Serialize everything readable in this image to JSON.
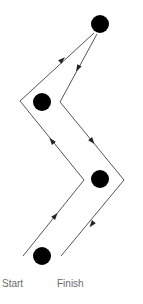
{
  "diagram": {
    "type": "path-around-obstacles",
    "colors": {
      "line": "#555555",
      "node": "#000000",
      "arrow": "#222222",
      "label": "#6b6b6b"
    },
    "nodes": [
      {
        "id": "top",
        "cx": 100,
        "cy": 24,
        "r": 9
      },
      {
        "id": "upper-left",
        "cx": 42,
        "cy": 102,
        "r": 9
      },
      {
        "id": "lower-right",
        "cx": 100,
        "cy": 179,
        "r": 9
      },
      {
        "id": "bottom",
        "cx": 42,
        "cy": 256,
        "r": 9
      }
    ],
    "outbound_path": {
      "points": [
        [
          23,
          256
        ],
        [
          84,
          180
        ],
        [
          20,
          101
        ],
        [
          94,
          33
        ]
      ],
      "direction": "up"
    },
    "return_path": {
      "points": [
        [
          97,
          34
        ],
        [
          60,
          102
        ],
        [
          124,
          180
        ],
        [
          61,
          256
        ]
      ],
      "direction": "down"
    },
    "arrows": [
      {
        "x": 55,
        "y": 216,
        "angle": -51
      },
      {
        "x": 52,
        "y": 141,
        "angle": -129
      },
      {
        "x": 62,
        "y": 60,
        "angle": -42
      },
      {
        "x": 78,
        "y": 68,
        "angle": 119
      },
      {
        "x": 92,
        "y": 141,
        "angle": 51
      },
      {
        "x": 92,
        "y": 224,
        "angle": 128
      }
    ],
    "labels": {
      "start": "Start",
      "finish": "Finish"
    }
  }
}
